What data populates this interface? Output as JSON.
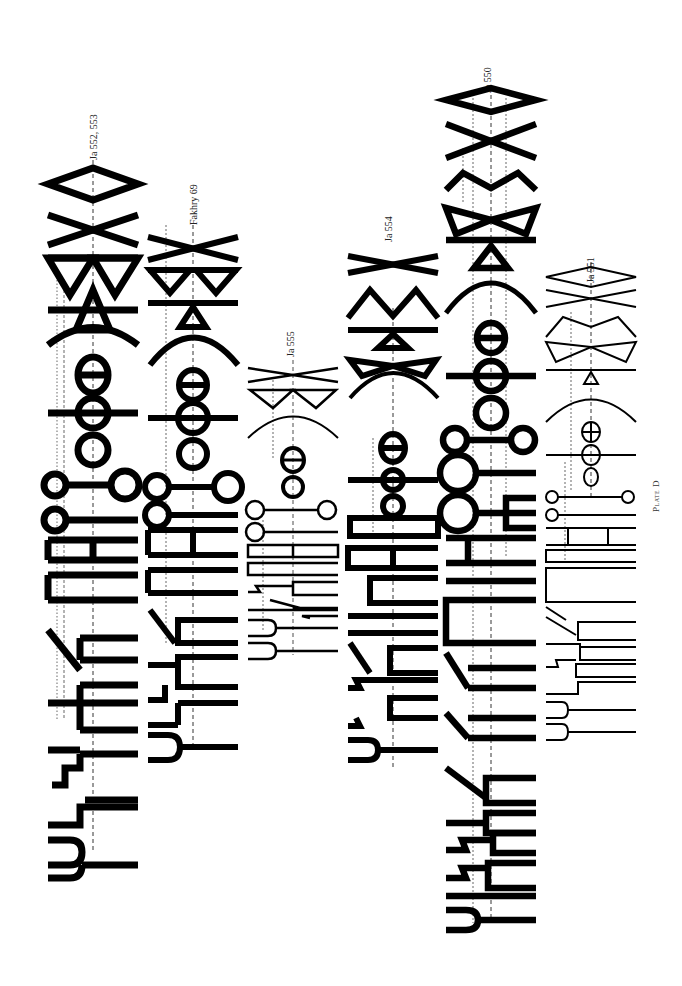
{
  "plate": {
    "title": "Plate D",
    "background": "#ffffff",
    "ink_color": "#000000"
  },
  "inscriptions": [
    {
      "id": "ja552_553",
      "label": "Ja 552, 553",
      "style": "heavy"
    },
    {
      "id": "fakhry69",
      "label": "Fakhry 69",
      "style": "heavy"
    },
    {
      "id": "ja555",
      "label": "Ja 555",
      "style": "light"
    },
    {
      "id": "ja554",
      "label": "Ja 554",
      "style": "heavy"
    },
    {
      "id": "ja550",
      "label": "Ja 550",
      "style": "heavy"
    },
    {
      "id": "ja551",
      "label": "Ja 551",
      "style": "light"
    }
  ]
}
